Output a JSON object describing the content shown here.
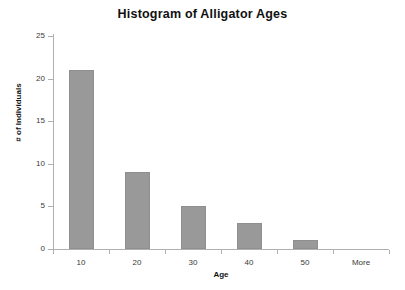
{
  "chart_data": {
    "type": "bar",
    "title": "Histogram of Alligator Ages",
    "xlabel": "Age",
    "ylabel": "# of Individuals",
    "categories": [
      "10",
      "20",
      "30",
      "40",
      "50",
      "More"
    ],
    "values": [
      21,
      9,
      5,
      3,
      1,
      0
    ],
    "series": [
      {
        "name": "# of Individuals",
        "values": [
          21,
          9,
          5,
          3,
          1,
          0
        ]
      }
    ],
    "ylim": [
      0,
      25
    ],
    "ytick_labels": [
      "0",
      "5",
      "10",
      "15",
      "20",
      "25"
    ],
    "ytick_values": [
      0,
      5,
      10,
      15,
      20,
      25
    ],
    "grid": false,
    "legend": "none",
    "bar_color": "#999999",
    "axis_color": "#b0b0b0",
    "background_color": "#ffffff"
  }
}
